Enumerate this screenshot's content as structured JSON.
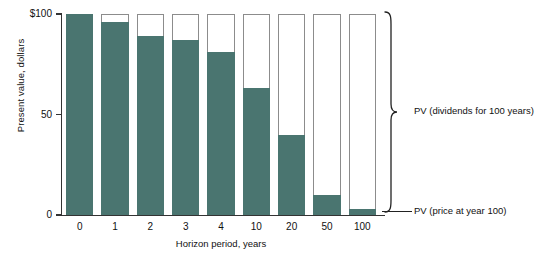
{
  "chart_data": {
    "type": "bar",
    "title": "",
    "xlabel": "Horizon period, years",
    "ylabel": "Present value, dollars",
    "categories": [
      "0",
      "1",
      "2",
      "3",
      "4",
      "10",
      "20",
      "50",
      "100"
    ],
    "ylim": [
      0,
      100
    ],
    "yticks": [
      0,
      50,
      100
    ],
    "ytick_labels": [
      "0",
      "50",
      "$100"
    ],
    "grid": false,
    "stacked": true,
    "series": [
      {
        "name": "PV (price at year 100)",
        "color": "#4a7570",
        "values": [
          100,
          96,
          89,
          87,
          81,
          63,
          40,
          10,
          3
        ]
      },
      {
        "name": "PV (dividends for 100 years)",
        "color": "#ffffff",
        "values": [
          0,
          4,
          11,
          13,
          19,
          37,
          60,
          90,
          97
        ]
      }
    ],
    "annotations": [
      {
        "id": "brace-dividends",
        "label": "PV (dividends for 100 years)",
        "kind": "brace"
      },
      {
        "id": "leader-price",
        "label": "PV (price at year 100)",
        "kind": "leader-line"
      }
    ],
    "legend": "none"
  }
}
